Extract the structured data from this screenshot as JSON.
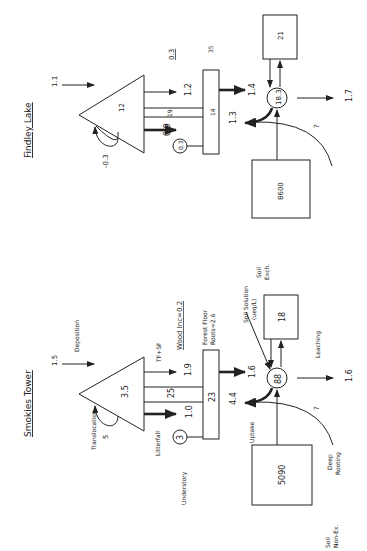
{
  "findley": {
    "title": "Findley Lake",
    "deposition": "1.1",
    "canopy": "12",
    "translocation": "-0.3",
    "tf_sf": "1.2",
    "stemflow_mid": "19",
    "litterfall": "0.9",
    "understory": "0.3",
    "forest_floor": "14",
    "forest_floor_roots": "35",
    "wood_inc": "0.3",
    "ff_to_solution": "1.4",
    "uptake": "1.3",
    "soil_solution": "18.3",
    "soil_exch": "21",
    "leaching": "1.7",
    "soil_nonex": "8600",
    "deep_rooting": "?"
  },
  "smokies": {
    "title": "Smokies Tower",
    "deposition_value": "1.5",
    "deposition_label": "Deposition",
    "canopy": "3.5",
    "translocation_label": "Translocation",
    "translocation_value": "5",
    "tf_sf_label": "TF+SF",
    "tf_sf": "1.9",
    "stemflow_mid": "25",
    "litterfall_label": "Litterfall",
    "litterfall": "1.0",
    "understory_label": "Understory",
    "understory": "3",
    "forest_floor": "23",
    "forest_floor_label": "Forest Floor",
    "roots_label": "Roots=2.6",
    "wood_inc": "Wood Inc=0.2",
    "ff_to_solution": "1.6",
    "uptake_label": "Uptake",
    "uptake": "4.4",
    "soil_solution_label_1": "Soil Solution",
    "soil_solution_label_2": "(ueq/L)",
    "soil_solution": "88",
    "soil_exch_label_1": "Soil",
    "soil_exch_label_2": "Exch.",
    "soil_exch": "18",
    "leaching_label": "Leaching",
    "leaching": "1.6",
    "soil_nonex_label_1": "Soil",
    "soil_nonex_label_2": "Non-Ex.",
    "soil_nonex": "5090",
    "deep_rooting_label_1": "Deep",
    "deep_rooting_label_2": "Rooting",
    "deep_rooting": "?"
  }
}
